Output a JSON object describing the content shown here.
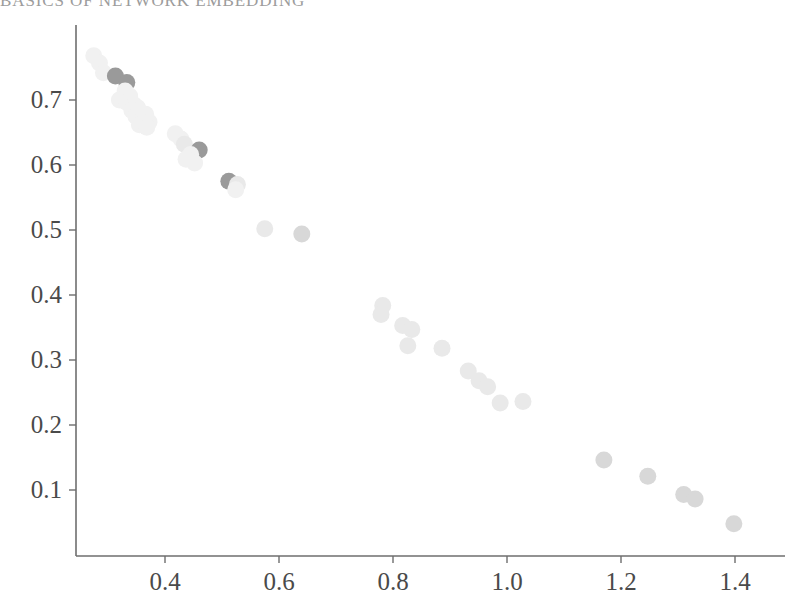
{
  "header": {
    "running_head": "BASICS OF NETWORK EMBEDDING"
  },
  "axes": {
    "x_ticks": [
      "0.4",
      "0.6",
      "0.8",
      "1.0",
      "1.2",
      "1.4"
    ],
    "y_ticks": [
      "0.7",
      "0.6",
      "0.5",
      "0.4",
      "0.3",
      "0.2",
      "0.1"
    ],
    "spine_color": "#6e6e6e"
  },
  "chart_data": {
    "type": "scatter",
    "title": "",
    "xlabel": "",
    "ylabel": "",
    "xlim": [
      0.245,
      1.47
    ],
    "ylim": [
      0.018,
      0.787
    ],
    "grid": false,
    "legend": null,
    "xticks": [
      0.4,
      0.6,
      0.8,
      1.0,
      1.2,
      1.4
    ],
    "yticks": [
      0.1,
      0.2,
      0.3,
      0.4,
      0.5,
      0.6,
      0.7
    ],
    "marker": "circle",
    "marker_size_px": 17,
    "colors": {
      "dark": "#9a9a9a",
      "mid": "#d8d8d8",
      "light": "#e9e9e9",
      "faint": "#f1f1f1"
    },
    "points": [
      {
        "x": 0.275,
        "y": 0.768,
        "shade": "faint"
      },
      {
        "x": 0.285,
        "y": 0.757,
        "shade": "faint"
      },
      {
        "x": 0.292,
        "y": 0.742,
        "shade": "faint"
      },
      {
        "x": 0.313,
        "y": 0.737,
        "shade": "dark"
      },
      {
        "x": 0.333,
        "y": 0.727,
        "shade": "dark"
      },
      {
        "x": 0.33,
        "y": 0.714,
        "shade": "faint"
      },
      {
        "x": 0.338,
        "y": 0.706,
        "shade": "faint"
      },
      {
        "x": 0.32,
        "y": 0.7,
        "shade": "faint"
      },
      {
        "x": 0.333,
        "y": 0.696,
        "shade": "faint"
      },
      {
        "x": 0.345,
        "y": 0.693,
        "shade": "faint"
      },
      {
        "x": 0.352,
        "y": 0.688,
        "shade": "faint"
      },
      {
        "x": 0.342,
        "y": 0.684,
        "shade": "faint"
      },
      {
        "x": 0.357,
        "y": 0.681,
        "shade": "faint"
      },
      {
        "x": 0.366,
        "y": 0.678,
        "shade": "faint"
      },
      {
        "x": 0.349,
        "y": 0.675,
        "shade": "faint"
      },
      {
        "x": 0.36,
        "y": 0.671,
        "shade": "faint"
      },
      {
        "x": 0.372,
        "y": 0.666,
        "shade": "faint"
      },
      {
        "x": 0.355,
        "y": 0.662,
        "shade": "faint"
      },
      {
        "x": 0.368,
        "y": 0.658,
        "shade": "faint"
      },
      {
        "x": 0.418,
        "y": 0.648,
        "shade": "faint"
      },
      {
        "x": 0.428,
        "y": 0.64,
        "shade": "faint"
      },
      {
        "x": 0.434,
        "y": 0.632,
        "shade": "light"
      },
      {
        "x": 0.46,
        "y": 0.623,
        "shade": "dark"
      },
      {
        "x": 0.445,
        "y": 0.616,
        "shade": "faint"
      },
      {
        "x": 0.437,
        "y": 0.609,
        "shade": "faint"
      },
      {
        "x": 0.452,
        "y": 0.603,
        "shade": "faint"
      },
      {
        "x": 0.512,
        "y": 0.575,
        "shade": "dark"
      },
      {
        "x": 0.527,
        "y": 0.57,
        "shade": "light"
      },
      {
        "x": 0.524,
        "y": 0.562,
        "shade": "faint"
      },
      {
        "x": 0.575,
        "y": 0.502,
        "shade": "light"
      },
      {
        "x": 0.64,
        "y": 0.494,
        "shade": "mid"
      },
      {
        "x": 0.782,
        "y": 0.384,
        "shade": "light"
      },
      {
        "x": 0.779,
        "y": 0.37,
        "shade": "light"
      },
      {
        "x": 0.817,
        "y": 0.353,
        "shade": "light"
      },
      {
        "x": 0.833,
        "y": 0.347,
        "shade": "light"
      },
      {
        "x": 0.826,
        "y": 0.322,
        "shade": "light"
      },
      {
        "x": 0.886,
        "y": 0.318,
        "shade": "light"
      },
      {
        "x": 0.932,
        "y": 0.283,
        "shade": "light"
      },
      {
        "x": 0.951,
        "y": 0.268,
        "shade": "light"
      },
      {
        "x": 0.966,
        "y": 0.259,
        "shade": "light"
      },
      {
        "x": 0.988,
        "y": 0.234,
        "shade": "light"
      },
      {
        "x": 1.028,
        "y": 0.236,
        "shade": "light"
      },
      {
        "x": 1.17,
        "y": 0.146,
        "shade": "mid"
      },
      {
        "x": 1.247,
        "y": 0.121,
        "shade": "mid"
      },
      {
        "x": 1.31,
        "y": 0.093,
        "shade": "mid"
      },
      {
        "x": 1.33,
        "y": 0.086,
        "shade": "mid"
      },
      {
        "x": 1.398,
        "y": 0.048,
        "shade": "mid"
      }
    ]
  }
}
